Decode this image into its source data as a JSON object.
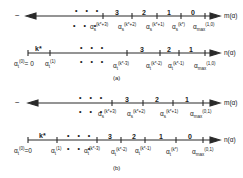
{
  "panels": [
    {
      "caption": "(a)",
      "m_axis": {
        "left_sign": "−",
        "axis_label": "m(α)",
        "ellipsis_above": "• • •",
        "ellipsis_below": "• • •",
        "segment_labels": [
          "3",
          "2",
          "1",
          "0"
        ],
        "ticks": [
          {
            "base": "α",
            "sub": "s",
            "sup": "(k*+3)"
          },
          {
            "base": "α",
            "sub": "s",
            "sup": "(k*+2)"
          },
          {
            "base": "α",
            "sub": "s",
            "sup": "(k*+1)"
          },
          {
            "base": "α",
            "sub": "s",
            "sup": "(k*)"
          },
          {
            "base": "α",
            "sub": "max",
            "sup": "(1,0)"
          }
        ]
      },
      "n_axis": {
        "axis_label": "n(α)",
        "first_segment_label": "k*",
        "ellipsis_above": "• • •",
        "ellipsis_below": "• • •",
        "segment_labels": [
          "3",
          "2",
          "1"
        ],
        "ticks": [
          {
            "base": "α",
            "sub": "t",
            "sup": "(0)",
            "suffix": "= 0"
          },
          {
            "base": "α",
            "sub": "t",
            "sup": "(1)"
          },
          {
            "base": "α",
            "sub": "t",
            "sup": "(k*-3)"
          },
          {
            "base": "α",
            "sub": "t",
            "sup": "(k*-2)"
          },
          {
            "base": "α",
            "sub": "t",
            "sup": "(k*-1)"
          },
          {
            "base": "α",
            "sub": "max",
            "sup": "(1,0)"
          }
        ]
      }
    },
    {
      "caption": "(b)",
      "m_axis": {
        "left_sign": "−",
        "axis_label": "m(α)",
        "ellipsis_above": "• • •",
        "ellipsis_below": "• • •",
        "segment_labels": [
          "3",
          "2",
          "1"
        ],
        "ticks": [
          {
            "base": "α",
            "sub": "s",
            "sup": "(k*+3)"
          },
          {
            "base": "α",
            "sub": "s",
            "sup": "(k*+2)"
          },
          {
            "base": "α",
            "sub": "s",
            "sup": "(k*+1)"
          },
          {
            "base": "α",
            "sub": "max",
            "sup": "(0,1)"
          }
        ]
      },
      "n_axis": {
        "axis_label": "n(α)",
        "first_segment_label": "k*",
        "ellipsis_above": "• • •",
        "ellipsis_below": "• • •",
        "segment_labels": [
          "3",
          "2",
          "1",
          "0"
        ],
        "ticks": [
          {
            "base": "α",
            "sub": "t",
            "sup": "(0)",
            "suffix": "=0"
          },
          {
            "base": "α",
            "sub": "t",
            "sup": "(1)"
          },
          {
            "base": "α",
            "sub": "t",
            "sup": "(k*-3)"
          },
          {
            "base": "α",
            "sub": "t",
            "sup": "(k*-2)"
          },
          {
            "base": "α",
            "sub": "t",
            "sup": "(k*-1)"
          },
          {
            "base": "α",
            "sub": "t",
            "sup": "(k*)"
          },
          {
            "base": "α",
            "sub": "max",
            "sup": "(0,1)"
          }
        ]
      }
    }
  ]
}
